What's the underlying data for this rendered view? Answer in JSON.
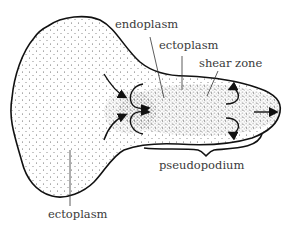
{
  "diagram": {
    "labels": {
      "endoplasm": "endoplasm",
      "ectoplasm_top": "ectoplasm",
      "shear_zone": "shear zone",
      "pseudopodium": "pseudopodium",
      "ectoplasm_bottom": "ectoplasm"
    },
    "arrows": {
      "inflow_count": 2,
      "fountain_count": 2,
      "direction_of_movement": "right"
    },
    "colors": {
      "outline": "#111111",
      "stipple": "#555555",
      "text": "#3a3a3a",
      "background": "#ffffff"
    }
  }
}
